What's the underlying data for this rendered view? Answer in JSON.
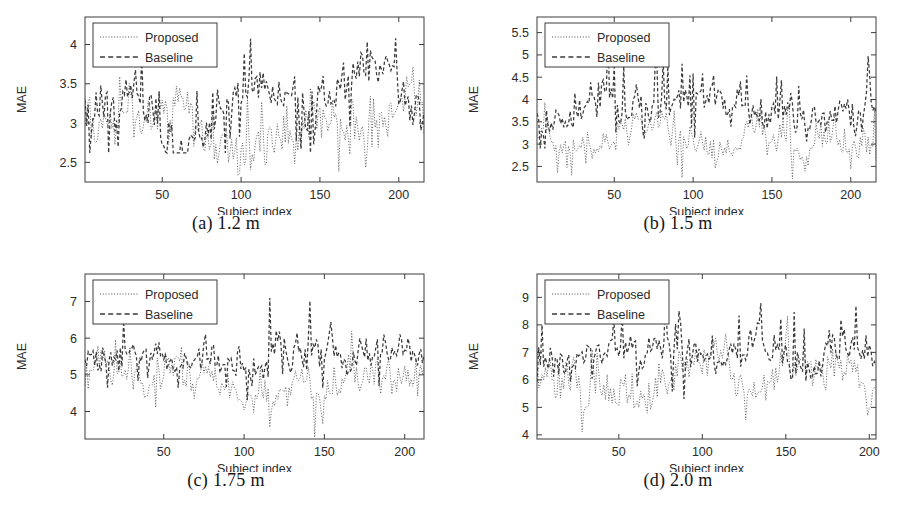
{
  "figure": {
    "title": "",
    "panel_count": 4,
    "shared_xlabel": "Subject index",
    "shared_ylabel": "MAE",
    "legend_entries": [
      "Proposed",
      "Baseline"
    ],
    "line_styles": {
      "proposed": "dotted",
      "baseline": "dashed"
    },
    "colors": {
      "proposed": "#4a4a4a",
      "baseline": "#3a3a3a",
      "axis": "#3c3c3c",
      "background": "#ffffff"
    }
  },
  "chart_data": [
    {
      "type": "line",
      "panel_id": "a",
      "caption": "(a) 1.2 m",
      "distance_m": 1.2,
      "title": "",
      "xlabel": "Subject index",
      "ylabel": "MAE",
      "xlim": [
        1,
        216
      ],
      "ylim": [
        2.25,
        4.35
      ],
      "xticks": [
        50,
        100,
        150,
        200
      ],
      "xtick_labels": [
        "50",
        "100",
        "150",
        "200"
      ],
      "yticks": [
        2.5,
        3,
        3.5,
        4
      ],
      "ytick_labels": [
        "2.5",
        "3",
        "3.5",
        "4"
      ],
      "grid": false,
      "legend_position": "upper-left",
      "n_points": 216,
      "series": [
        {
          "name": "Proposed",
          "style": "dotted",
          "mean": 3.02,
          "min": 2.3,
          "max": 3.95,
          "seed": 101,
          "baseline_level": 3.02,
          "noise_amplitude": 0.36,
          "spike_amplitude": 0.55
        },
        {
          "name": "Baseline",
          "style": "dashed",
          "mean": 3.3,
          "min": 2.62,
          "max": 4.3,
          "seed": 202,
          "baseline_level": 3.3,
          "noise_amplitude": 0.32,
          "spike_amplitude": 0.7
        }
      ]
    },
    {
      "type": "line",
      "panel_id": "b",
      "caption": "(b) 1.5 m",
      "distance_m": 1.5,
      "title": "",
      "xlabel": "Subject index",
      "ylabel": "MAE",
      "xlim": [
        1,
        216
      ],
      "ylim": [
        2.15,
        5.85
      ],
      "xticks": [
        50,
        100,
        150,
        200
      ],
      "xtick_labels": [
        "50",
        "100",
        "150",
        "200"
      ],
      "yticks": [
        2.5,
        3,
        3.5,
        4,
        4.5,
        5,
        5.5
      ],
      "ytick_labels": [
        "2.5",
        "3",
        "3.5",
        "4",
        "4.5",
        "5",
        "5.5"
      ],
      "grid": false,
      "legend_position": "upper-left",
      "n_points": 216,
      "series": [
        {
          "name": "Proposed",
          "style": "dotted",
          "mean": 3.15,
          "min": 2.2,
          "max": 4.7,
          "seed": 303,
          "baseline_level": 3.15,
          "noise_amplitude": 0.4,
          "spike_amplitude": 0.75
        },
        {
          "name": "Baseline",
          "style": "dashed",
          "mean": 3.8,
          "min": 2.9,
          "max": 5.75,
          "seed": 404,
          "baseline_level": 3.8,
          "noise_amplitude": 0.45,
          "spike_amplitude": 1.1
        }
      ]
    },
    {
      "type": "line",
      "panel_id": "c",
      "caption": "(c) 1.75 m",
      "distance_m": 1.75,
      "title": "",
      "xlabel": "Subject index",
      "ylabel": "MAE",
      "xlim": [
        1,
        212
      ],
      "ylim": [
        3.25,
        7.75
      ],
      "xticks": [
        50,
        100,
        150,
        200
      ],
      "xtick_labels": [
        "50",
        "100",
        "150",
        "200"
      ],
      "yticks": [
        4,
        5,
        6,
        7
      ],
      "ytick_labels": [
        "4",
        "5",
        "6",
        "7"
      ],
      "grid": false,
      "legend_position": "upper-left",
      "n_points": 212,
      "series": [
        {
          "name": "Proposed",
          "style": "dotted",
          "mean": 4.82,
          "min": 3.3,
          "max": 6.4,
          "seed": 505,
          "baseline_level": 4.82,
          "noise_amplitude": 0.55,
          "spike_amplitude": 0.85
        },
        {
          "name": "Baseline",
          "style": "dashed",
          "mean": 5.45,
          "min": 4.2,
          "max": 7.65,
          "seed": 606,
          "baseline_level": 5.45,
          "noise_amplitude": 0.5,
          "spike_amplitude": 1.3
        }
      ]
    },
    {
      "type": "line",
      "panel_id": "d",
      "caption": "(d) 2.0 m",
      "distance_m": 2.0,
      "title": "",
      "xlabel": "Subject index",
      "ylabel": "MAE",
      "xlim": [
        1,
        204
      ],
      "ylim": [
        3.85,
        9.85
      ],
      "xticks": [
        50,
        100,
        150,
        200
      ],
      "xtick_labels": [
        "50",
        "100",
        "150",
        "200"
      ],
      "yticks": [
        4,
        5,
        6,
        7,
        8,
        9
      ],
      "ytick_labels": [
        "4",
        "5",
        "6",
        "7",
        "8",
        "9"
      ],
      "grid": false,
      "legend_position": "upper-left",
      "n_points": 204,
      "series": [
        {
          "name": "Proposed",
          "style": "dotted",
          "mean": 6.15,
          "min": 3.95,
          "max": 8.6,
          "seed": 707,
          "baseline_level": 6.15,
          "noise_amplitude": 0.78,
          "spike_amplitude": 1.25
        },
        {
          "name": "Baseline",
          "style": "dashed",
          "mean": 6.95,
          "min": 5.3,
          "max": 9.8,
          "seed": 808,
          "baseline_level": 6.95,
          "noise_amplitude": 0.7,
          "spike_amplitude": 1.7
        }
      ]
    }
  ]
}
